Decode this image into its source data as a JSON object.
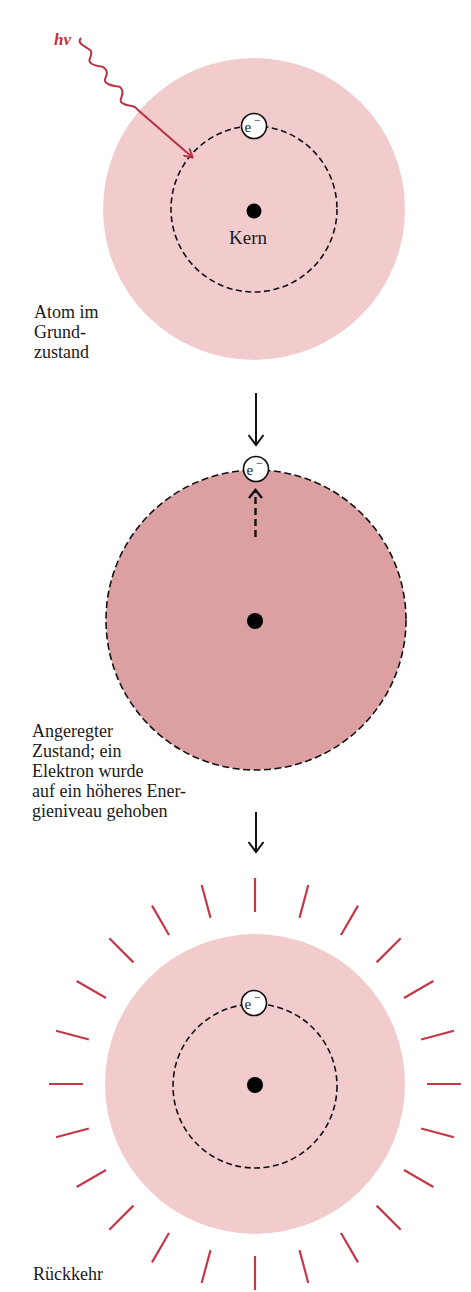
{
  "colors": {
    "ground_state_fill": "#f2cccc",
    "excited_state_fill": "#dda0a2",
    "photon_red": "#b83344",
    "ray_red": "#c4384a",
    "ink": "#111111"
  },
  "photon": {
    "label": "hv"
  },
  "stage1": {
    "electron_label": "e",
    "electron_charge": "−",
    "nucleus_label": "Kern",
    "caption": "Atom im\nGrund-\nzustand"
  },
  "stage2": {
    "electron_label": "e",
    "electron_charge": "−",
    "caption": "Angeregter\nZustand; ein\nElektron wurde\nauf ein höheres Ener-\ngieniveau gehoben"
  },
  "stage3": {
    "electron_label": "e",
    "electron_charge": "−",
    "caption": "Rückkehr",
    "ray_count": 24
  },
  "icons": {
    "down_arrow_1": "down-arrow",
    "down_arrow_2": "down-arrow",
    "excitation_arrow": "dashed-up-arrow",
    "photon_wave": "wavy-arrow"
  }
}
